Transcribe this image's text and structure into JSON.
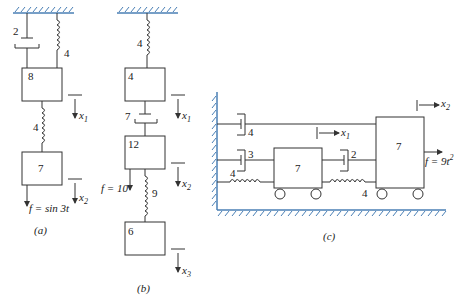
{
  "figure_a": {
    "caption": "(a)",
    "damper_label": "2",
    "top_spring_label": "4",
    "mass1_label": "8",
    "middle_spring_label": "4",
    "mass2_label": "7",
    "x1_label": "x",
    "x1_sub": "1",
    "x2_label": "x",
    "x2_sub": "2",
    "force_label": "f = sin 3t"
  },
  "figure_b": {
    "caption": "(b)",
    "top_spring_label": "4",
    "mass1_label": "4",
    "damper_label": "7",
    "mass2_label": "12",
    "spring2_label": "9",
    "mass3_label": "6",
    "force_label": "f = 10",
    "x1_label": "x",
    "x1_sub": "1",
    "x2_label": "x",
    "x2_sub": "2",
    "x3_label": "x",
    "x3_sub": "3"
  },
  "figure_c": {
    "caption": "(c)",
    "top_damper_label": "4",
    "left_damper_label": "3",
    "left_spring_label": "4",
    "mass1_label": "7",
    "mid_damper_label": "2",
    "mid_spring_label": "4",
    "mass2_label": "7",
    "force_label": "f = 9t",
    "force_exp": "2",
    "x1_label": "x",
    "x1_sub": "1",
    "x2_label": "x",
    "x2_sub": "2"
  },
  "colors": {
    "line": "#333333",
    "ground_hatch": "#4a7fb5"
  }
}
